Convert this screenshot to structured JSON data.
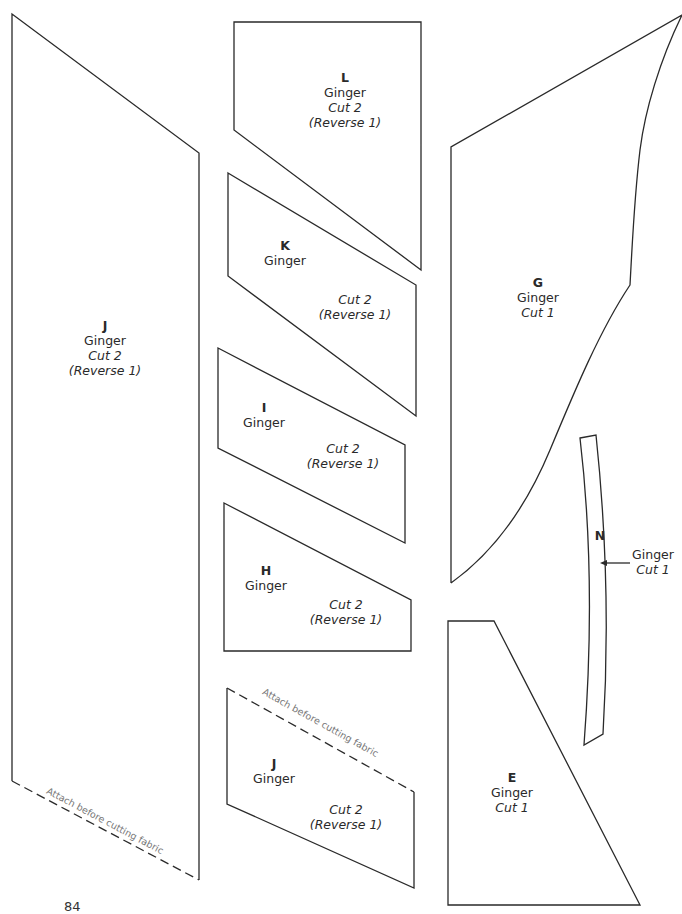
{
  "pieces": {
    "J_large": {
      "letter": "J",
      "color": "Ginger",
      "cut": "Cut 2",
      "reverse": "(Reverse 1)",
      "note": "Attach before cutting fabric"
    },
    "L": {
      "letter": "L",
      "color": "Ginger",
      "cut": "Cut 2",
      "reverse": "(Reverse 1)"
    },
    "K": {
      "letter": "K",
      "color": "Ginger",
      "cut": "Cut 2",
      "reverse": "(Reverse 1)"
    },
    "I": {
      "letter": "I",
      "color": "Ginger",
      "cut": "Cut 2",
      "reverse": "(Reverse 1)"
    },
    "H": {
      "letter": "H",
      "color": "Ginger",
      "cut": "Cut 2",
      "reverse": "(Reverse 1)"
    },
    "J_small": {
      "letter": "J",
      "color": "Ginger",
      "cut": "Cut 2",
      "reverse": "(Reverse 1)",
      "note": "Attach before cutting fabric"
    },
    "G": {
      "letter": "G",
      "color": "Ginger",
      "cut": "Cut 1"
    },
    "N": {
      "letter": "N",
      "color": "Ginger",
      "cut": "Cut 1"
    },
    "E": {
      "letter": "E",
      "color": "Ginger",
      "cut": "Cut 1"
    }
  },
  "page_number": "84",
  "colors": {
    "outline": "#2a2a2a",
    "note_text": "#777777"
  }
}
